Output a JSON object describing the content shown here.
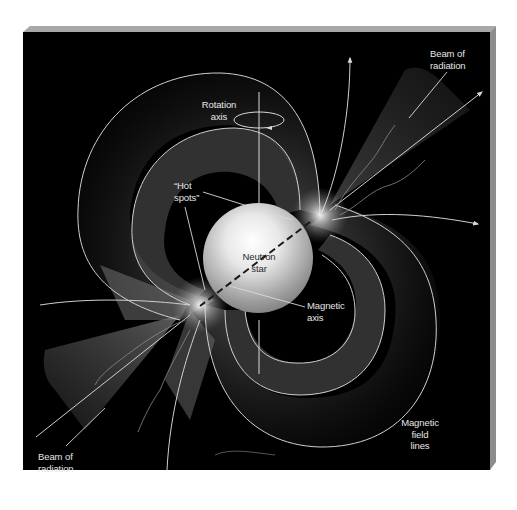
{
  "figure": {
    "background_color": "#000000",
    "frame_color": "#9a9a9a",
    "line_color": "#d9d9d9"
  },
  "labels": {
    "rotation_axis": "Rotation\naxis",
    "hot_spots": "“Hot\nspots”",
    "neutron_star": "Neutron\nstar",
    "magnetic_axis": "Magnetic\naxis",
    "beam_top": "Beam of\nradiation",
    "beam_bottom": "Beam of\nradiation",
    "field_lines": "Magnetic\nfield\nlines"
  }
}
